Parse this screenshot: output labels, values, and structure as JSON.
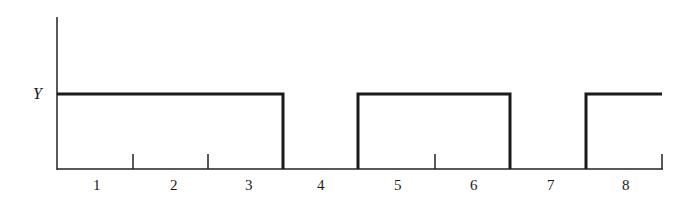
{
  "diagram": {
    "type": "pulse-waveform",
    "y_axis_label": "Y",
    "x_labels": [
      "1",
      "2",
      "3",
      "4",
      "5",
      "6",
      "7",
      "8"
    ],
    "pulses": [
      {
        "start_slot": 1,
        "end_slot": 3,
        "level": "Y"
      },
      {
        "start_slot": 5,
        "end_slot": 6,
        "level": "Y"
      },
      {
        "start_slot": 8,
        "end_slot": 8,
        "level": "Y"
      }
    ],
    "ticks_between_slots": [
      "1|2",
      "2|3",
      "5|6",
      "end of 8"
    ],
    "colors": {
      "line": "#1a1a1a",
      "background": "#ffffff"
    }
  },
  "labels": {
    "y": "Y",
    "x1": "1",
    "x2": "2",
    "x3": "3",
    "x4": "4",
    "x5": "5",
    "x6": "6",
    "x7": "7",
    "x8": "8"
  }
}
